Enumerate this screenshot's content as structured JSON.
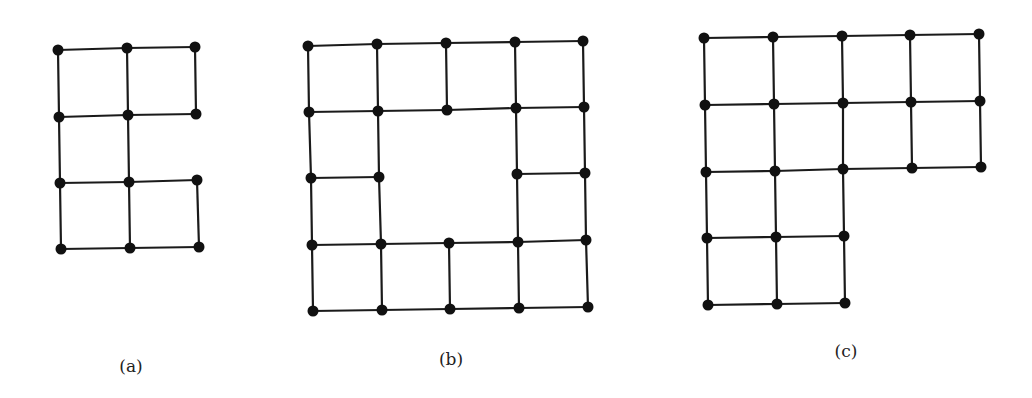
{
  "figure": {
    "background": "#ffffff",
    "stroke_color": "#1a1a1a",
    "vertex_color": "#111111",
    "edge_width": 2.2,
    "vertex_radius": 5.5,
    "graphs": [
      {
        "id": "a",
        "label": "(a)",
        "label_pos": [
          131,
          366
        ],
        "vertices": {
          "a11": [
            58,
            50
          ],
          "a12": [
            127,
            48
          ],
          "a13": [
            195,
            47
          ],
          "a21": [
            59,
            117
          ],
          "a22": [
            128,
            115
          ],
          "a23": [
            196,
            114
          ],
          "a31": [
            60,
            183
          ],
          "a32": [
            129,
            182
          ],
          "a33": [
            197,
            180
          ],
          "a41": [
            61,
            249
          ],
          "a42": [
            130,
            248
          ],
          "a43": [
            199,
            247
          ]
        },
        "edges": [
          [
            "a11",
            "a12"
          ],
          [
            "a12",
            "a13"
          ],
          [
            "a21",
            "a22"
          ],
          [
            "a22",
            "a23"
          ],
          [
            "a31",
            "a32"
          ],
          [
            "a32",
            "a33"
          ],
          [
            "a41",
            "a42"
          ],
          [
            "a42",
            "a43"
          ],
          [
            "a11",
            "a21"
          ],
          [
            "a21",
            "a31"
          ],
          [
            "a31",
            "a41"
          ],
          [
            "a12",
            "a22"
          ],
          [
            "a22",
            "a32"
          ],
          [
            "a32",
            "a42"
          ],
          [
            "a13",
            "a23"
          ],
          [
            "a33",
            "a43"
          ]
        ]
      },
      {
        "id": "b",
        "label": "(b)",
        "label_pos": [
          451,
          359
        ],
        "vertices": {
          "b11": [
            308,
            46
          ],
          "b12": [
            377,
            44
          ],
          "b13": [
            446,
            43
          ],
          "b14": [
            515,
            42
          ],
          "b15": [
            583,
            41
          ],
          "b21": [
            309,
            112
          ],
          "b22": [
            378,
            111
          ],
          "b23": [
            447,
            110
          ],
          "b24": [
            516,
            108
          ],
          "b25": [
            584,
            107
          ],
          "b31": [
            311,
            178
          ],
          "b32": [
            379,
            177
          ],
          "b34": [
            517,
            174
          ],
          "b35": [
            585,
            173
          ],
          "b41": [
            312,
            245
          ],
          "b42": [
            381,
            244
          ],
          "b43": [
            449,
            243
          ],
          "b44": [
            518,
            242
          ],
          "b45": [
            586,
            240
          ],
          "b51": [
            313,
            311
          ],
          "b52": [
            382,
            310
          ],
          "b53": [
            450,
            309
          ],
          "b54": [
            519,
            308
          ],
          "b55": [
            588,
            307
          ]
        },
        "edges": [
          [
            "b11",
            "b12"
          ],
          [
            "b12",
            "b13"
          ],
          [
            "b13",
            "b14"
          ],
          [
            "b14",
            "b15"
          ],
          [
            "b21",
            "b22"
          ],
          [
            "b22",
            "b23"
          ],
          [
            "b23",
            "b24"
          ],
          [
            "b24",
            "b25"
          ],
          [
            "b31",
            "b32"
          ],
          [
            "b34",
            "b35"
          ],
          [
            "b41",
            "b42"
          ],
          [
            "b42",
            "b43"
          ],
          [
            "b43",
            "b44"
          ],
          [
            "b44",
            "b45"
          ],
          [
            "b51",
            "b52"
          ],
          [
            "b52",
            "b53"
          ],
          [
            "b53",
            "b54"
          ],
          [
            "b54",
            "b55"
          ],
          [
            "b11",
            "b21"
          ],
          [
            "b21",
            "b31"
          ],
          [
            "b31",
            "b41"
          ],
          [
            "b41",
            "b51"
          ],
          [
            "b12",
            "b22"
          ],
          [
            "b22",
            "b32"
          ],
          [
            "b32",
            "b42"
          ],
          [
            "b42",
            "b52"
          ],
          [
            "b13",
            "b23"
          ],
          [
            "b43",
            "b53"
          ],
          [
            "b14",
            "b24"
          ],
          [
            "b24",
            "b34"
          ],
          [
            "b34",
            "b44"
          ],
          [
            "b44",
            "b54"
          ],
          [
            "b15",
            "b25"
          ],
          [
            "b25",
            "b35"
          ],
          [
            "b35",
            "b45"
          ],
          [
            "b45",
            "b55"
          ]
        ]
      },
      {
        "id": "c",
        "label": "(c)",
        "label_pos": [
          846,
          351
        ],
        "vertices": {
          "c11": [
            704,
            38
          ],
          "c12": [
            773,
            37
          ],
          "c13": [
            842,
            36
          ],
          "c14": [
            910,
            35
          ],
          "c15": [
            979,
            34
          ],
          "c21": [
            705,
            105
          ],
          "c22": [
            774,
            104
          ],
          "c23": [
            843,
            103
          ],
          "c24": [
            911,
            102
          ],
          "c25": [
            980,
            101
          ],
          "c31": [
            706,
            172
          ],
          "c32": [
            775,
            171
          ],
          "c33": [
            843,
            169
          ],
          "c34": [
            912,
            168
          ],
          "c35": [
            981,
            167
          ],
          "c41": [
            707,
            238
          ],
          "c42": [
            776,
            237
          ],
          "c43": [
            844,
            236
          ],
          "c51": [
            708,
            305
          ],
          "c52": [
            777,
            304
          ],
          "c53": [
            845,
            303
          ]
        },
        "edges": [
          [
            "c11",
            "c12"
          ],
          [
            "c12",
            "c13"
          ],
          [
            "c13",
            "c14"
          ],
          [
            "c14",
            "c15"
          ],
          [
            "c21",
            "c22"
          ],
          [
            "c22",
            "c23"
          ],
          [
            "c23",
            "c24"
          ],
          [
            "c24",
            "c25"
          ],
          [
            "c31",
            "c32"
          ],
          [
            "c32",
            "c33"
          ],
          [
            "c33",
            "c34"
          ],
          [
            "c34",
            "c35"
          ],
          [
            "c41",
            "c42"
          ],
          [
            "c42",
            "c43"
          ],
          [
            "c51",
            "c52"
          ],
          [
            "c52",
            "c53"
          ],
          [
            "c11",
            "c21"
          ],
          [
            "c21",
            "c31"
          ],
          [
            "c31",
            "c41"
          ],
          [
            "c41",
            "c51"
          ],
          [
            "c12",
            "c22"
          ],
          [
            "c22",
            "c32"
          ],
          [
            "c32",
            "c42"
          ],
          [
            "c42",
            "c52"
          ],
          [
            "c13",
            "c23"
          ],
          [
            "c23",
            "c33"
          ],
          [
            "c33",
            "c43"
          ],
          [
            "c43",
            "c53"
          ],
          [
            "c14",
            "c24"
          ],
          [
            "c24",
            "c34"
          ],
          [
            "c15",
            "c25"
          ],
          [
            "c25",
            "c35"
          ]
        ]
      }
    ]
  }
}
